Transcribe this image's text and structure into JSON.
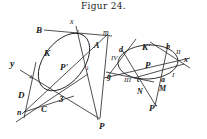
{
  "title": "Figur 24.",
  "left_figure": {
    "labels": {
      "x": "x",
      "B": "B",
      "m": "m",
      "K": "K",
      "A": "A",
      "P_prime": "P'",
      "one": "1",
      "two": "2",
      "y": "y",
      "four": "4",
      "D": "D",
      "three": "3",
      "C": "C",
      "n": "n",
      "P": "P"
    }
  },
  "right_figure": {
    "labels": {
      "d": "d",
      "K_prime": "K'",
      "b": "b",
      "II": "II",
      "x": "x",
      "IV": "IV",
      "P": "P",
      "g": "g",
      "III": "III",
      "c": "c",
      "a": "a",
      "I": "I",
      "N": "N",
      "M": "M",
      "P_prime": "P'"
    }
  }
}
